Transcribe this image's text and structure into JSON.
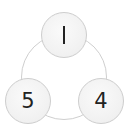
{
  "diagram": {
    "type": "cycle",
    "connector": "circle",
    "nodes": [
      {
        "position": "top",
        "label": "1"
      },
      {
        "position": "bottom-right",
        "label": "4"
      },
      {
        "position": "bottom-left",
        "label": "5"
      }
    ],
    "colors": {
      "node_fill": "#f2f2f2",
      "node_border": "#cdcdcd",
      "ring": "#cfcfcf",
      "text": "#222222"
    }
  }
}
